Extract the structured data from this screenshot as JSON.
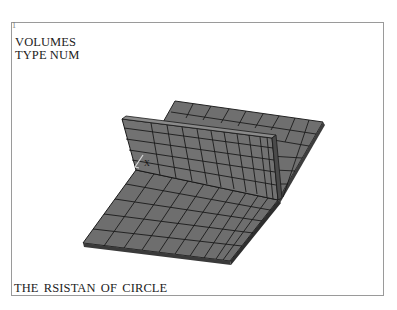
{
  "viewport": {
    "title_line1": "VOLUMES",
    "title_line2": "TYPE NUM",
    "window_index": "1",
    "caption": "THE  RSISTAN  OF  CIRCLE",
    "axis_label": "X"
  },
  "model": {
    "description": "Meshed 3D volume: base plate with vertical wall (flange), gray elements with black mesh lines",
    "element_color": "#6e6e6e",
    "mesh_line_color": "#1a1a1a",
    "background": "#ffffff"
  }
}
